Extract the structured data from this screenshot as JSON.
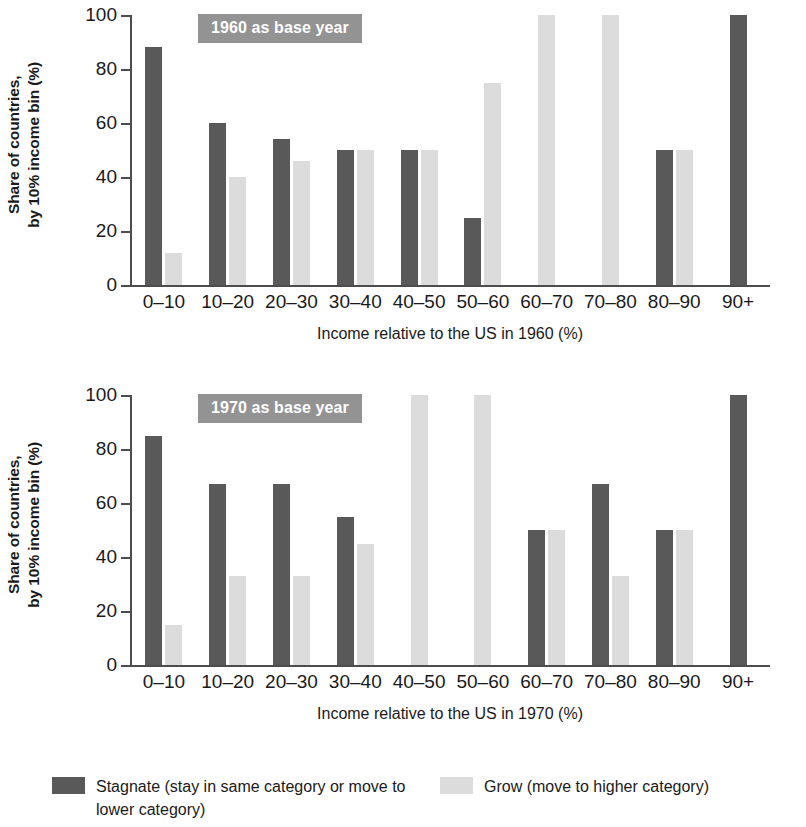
{
  "legend": {
    "stagnate_label": "Stagnate (stay in same category or move to lower category)",
    "grow_label": "Grow (move to higher category)",
    "stagnate_color": "#595959",
    "grow_color": "#dcdcdc"
  },
  "panels": [
    {
      "badge": "1960 as base year",
      "ylabel_line1": "Share of countries,",
      "ylabel_line2": "by 10% income bin (%)",
      "xlabel": "Income relative to the US in 1960 (%)"
    },
    {
      "badge": "1970 as base year",
      "ylabel_line1": "Share of countries,",
      "ylabel_line2": "by 10% income bin (%)",
      "xlabel": "Income relative to the US in 1970 (%)"
    }
  ],
  "chart_data": [
    {
      "type": "bar",
      "title": "1960 as base year",
      "xlabel": "Income relative to the US in 1960 (%)",
      "ylabel": "Share of countries, by 10% income bin (%)",
      "categories": [
        "0–10",
        "10–20",
        "20–30",
        "30–40",
        "40–50",
        "50–60",
        "60–70",
        "70–80",
        "80–90",
        "90+"
      ],
      "series": [
        {
          "name": "Stagnate (stay in same category or move to lower category)",
          "color": "#595959",
          "values": [
            88,
            60,
            54,
            50,
            50,
            25,
            0,
            0,
            50,
            100
          ]
        },
        {
          "name": "Grow (move to higher category)",
          "color": "#dcdcdc",
          "values": [
            12,
            40,
            46,
            50,
            50,
            75,
            100,
            100,
            50,
            0
          ]
        }
      ],
      "yticks": [
        0,
        20,
        40,
        60,
        80,
        100
      ],
      "ylim": [
        0,
        100
      ],
      "grid": false,
      "legend_position": "bottom"
    },
    {
      "type": "bar",
      "title": "1970 as base year",
      "xlabel": "Income relative to the US in 1970 (%)",
      "ylabel": "Share of countries, by 10% income bin (%)",
      "categories": [
        "0–10",
        "10–20",
        "20–30",
        "30–40",
        "40–50",
        "50–60",
        "60–70",
        "70–80",
        "80–90",
        "90+"
      ],
      "series": [
        {
          "name": "Stagnate (stay in same category or move to lower category)",
          "color": "#595959",
          "values": [
            85,
            67,
            67,
            55,
            0,
            0,
            50,
            67,
            50,
            100
          ]
        },
        {
          "name": "Grow (move to higher category)",
          "color": "#dcdcdc",
          "values": [
            15,
            33,
            33,
            45,
            100,
            100,
            50,
            33,
            50,
            0
          ]
        }
      ],
      "yticks": [
        0,
        20,
        40,
        60,
        80,
        100
      ],
      "ylim": [
        0,
        100
      ],
      "grid": false,
      "legend_position": "bottom"
    }
  ]
}
